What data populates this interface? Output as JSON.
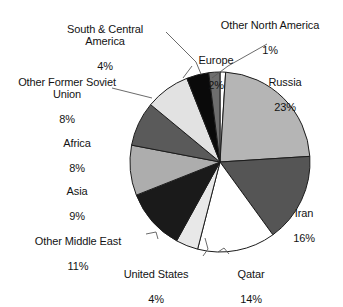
{
  "chart_data": {
    "type": "pie",
    "title": "",
    "subtitle": "",
    "xlabel": "",
    "ylabel": "",
    "legend_position": "none",
    "grid": false,
    "labels_show_percent": true,
    "start_angle_deg": 0,
    "direction": "clockwise",
    "categories": [
      "Other North America",
      "Russia",
      "Iran",
      "Qatar",
      "United States",
      "Other Middle East",
      "Asia",
      "Africa",
      "Other Former Soviet Union",
      "South & Central America",
      "Europe"
    ],
    "values": [
      1,
      23,
      16,
      14,
      4,
      11,
      9,
      8,
      8,
      4,
      2
    ],
    "value_labels": [
      "1%",
      "23%",
      "16%",
      "14%",
      "4%",
      "11%",
      "9%",
      "8%",
      "8%",
      "4%",
      "2%"
    ],
    "colors": [
      "#ffffff",
      "#b5b5b5",
      "#555555",
      "#ffffff",
      "#e8e8e8",
      "#1a1a1a",
      "#adadad",
      "#5a5a5a",
      "#e2e2e2",
      "#0a0a0a",
      "#6e6e6e"
    ],
    "slice_outline_color": "#1c1c1c",
    "leader_line_color": "#5a5a5a",
    "background": "#ffffff"
  },
  "labels": {
    "other_north_america": {
      "name": "Other North America",
      "percent": "1%"
    },
    "russia": {
      "name": "Russia",
      "percent": "23%"
    },
    "iran": {
      "name": "Iran",
      "percent": "16%"
    },
    "qatar": {
      "name": "Qatar",
      "percent": "14%"
    },
    "united_states": {
      "name": "United States",
      "percent": "4%"
    },
    "other_middle_east": {
      "name": "Other Middle East",
      "percent": "11%"
    },
    "asia": {
      "name": "Asia",
      "percent": "9%"
    },
    "africa": {
      "name": "Africa",
      "percent": "8%"
    },
    "other_former_soviet": {
      "name": "Other Former Soviet\nUnion",
      "percent": "8%"
    },
    "south_central": {
      "name": "South & Central\nAmerica",
      "percent": "4%"
    },
    "europe": {
      "name": "Europe",
      "percent": "2%"
    }
  }
}
